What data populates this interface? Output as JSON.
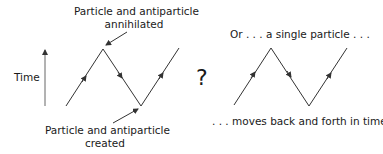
{
  "left_diagram": {
    "label_top_line1": "Particle and antiparticle",
    "label_top_line2": "annihilated",
    "label_bottom_line1": "Particle and antiparticle",
    "label_bottom_line2": "created",
    "axis_label": "Time"
  },
  "connector": "?",
  "right_diagram": {
    "label_top": "Or . . . a single particle . . .",
    "label_bottom": ". . . moves back and forth in time"
  },
  "colors": {
    "line": "#333333",
    "text": "#1a1a1a"
  }
}
